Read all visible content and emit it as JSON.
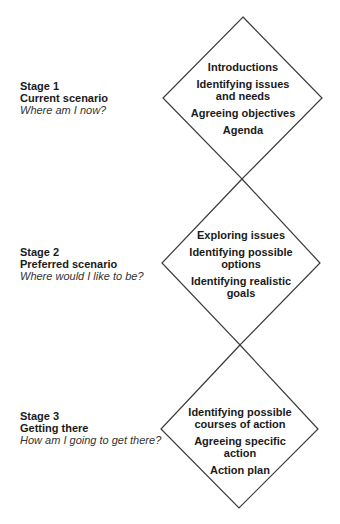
{
  "diagram": {
    "cropped_top_text": "...ning...",
    "line_color": "#3a3a3a",
    "stages": [
      {
        "number_label": "Stage 1",
        "title": "Current scenario",
        "question": "Where am I now?",
        "activities": [
          "Introductions",
          "Identifying issues and needs",
          "Agreeing objectives",
          "Agenda"
        ]
      },
      {
        "number_label": "Stage 2",
        "title": "Preferred scenario",
        "question": "Where would I like to be?",
        "activities": [
          "Exploring issues",
          "Identifying possible options",
          "Identifying realistic goals"
        ]
      },
      {
        "number_label": "Stage 3",
        "title": "Getting there",
        "question": "How am I going to get there?",
        "activities": [
          "Identifying possible courses of action",
          "Agreeing specific action",
          "Action plan"
        ]
      }
    ]
  }
}
